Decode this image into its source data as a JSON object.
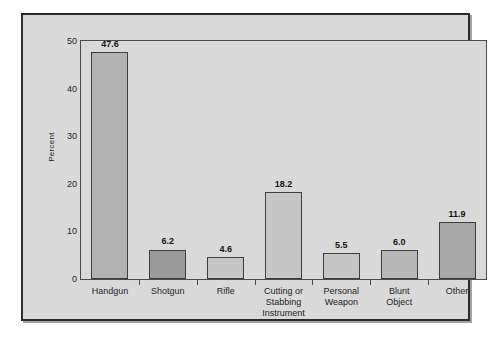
{
  "chart_data": {
    "type": "bar",
    "title": "",
    "subtitle": "",
    "xlabel": "",
    "ylabel": "Percent",
    "ylim": [
      0,
      50
    ],
    "yticks": [
      0,
      10,
      20,
      30,
      40,
      50
    ],
    "ytick_labels": [
      "0",
      "10",
      "20",
      "30",
      "40",
      "50"
    ],
    "grid": false,
    "legend": null,
    "categories": [
      "Handgun",
      "Shotgun",
      "Rifle",
      "Cutting or\nStabbing\nInstrument",
      "Personal\nWeapon",
      "Blunt\nObject",
      "Other"
    ],
    "values": [
      47.6,
      6.2,
      4.6,
      18.2,
      5.5,
      6.0,
      11.9
    ],
    "value_labels": [
      "47.6",
      "6.2",
      "4.6",
      "18.2",
      "5.5",
      "6.0",
      "11.9"
    ],
    "bar_colors": [
      "#b3b3b3",
      "#9a9a9a",
      "#c6c6c6",
      "#c6c6c6",
      "#c6c6c6",
      "#b8b8b8",
      "#a8a8a8"
    ],
    "bar_edge_color": "#3d3d3d"
  },
  "style": {
    "page_background": "#ffffff",
    "panel_background": "#d9d9d9",
    "panel_border": "#2b2b2b",
    "axis_color": "#4a4a4a",
    "text_color": "#1d1d1d"
  }
}
